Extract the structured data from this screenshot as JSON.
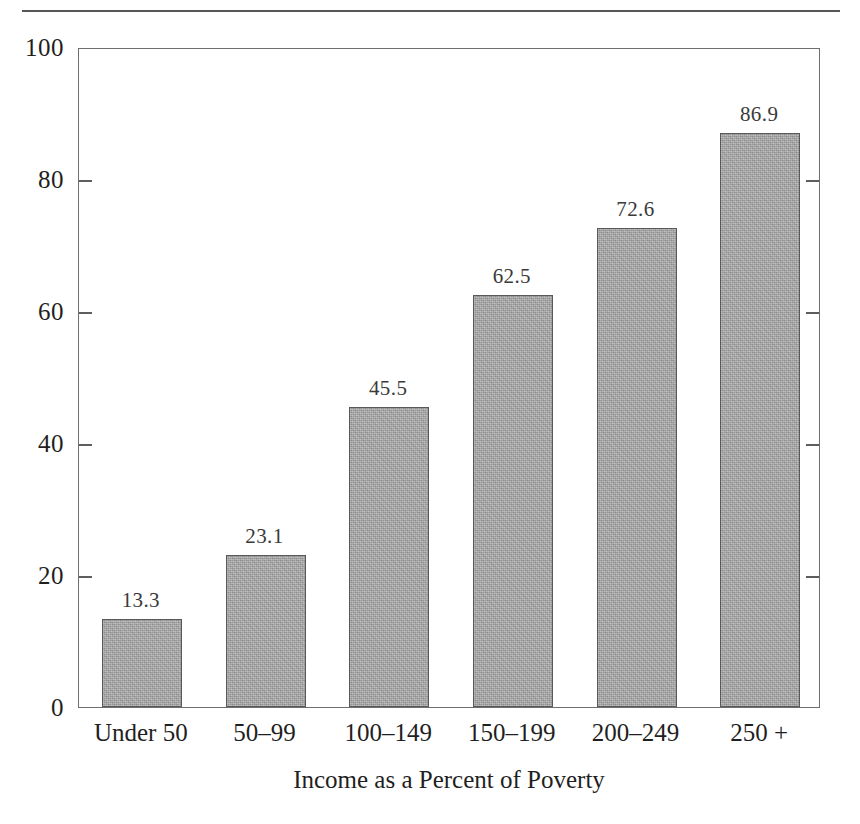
{
  "chart_data": {
    "type": "bar",
    "title": "",
    "subtitle": "",
    "xlabel": "Income as a Percent of Poverty",
    "ylabel": "",
    "categories": [
      "Under 50",
      "50–99",
      "100–149",
      "150–199",
      "200–249",
      "250 +"
    ],
    "values": [
      13.3,
      23.1,
      45.5,
      62.5,
      72.6,
      86.9
    ],
    "value_labels": [
      "13.3",
      "23.1",
      "45.5",
      "62.5",
      "72.6",
      "86.9"
    ],
    "ylim": [
      0,
      100
    ],
    "ytick_values": [
      0,
      20,
      40,
      60,
      80,
      100
    ],
    "ytick_labels": [
      "0",
      "20",
      "40",
      "60",
      "80",
      "100"
    ],
    "grid": false,
    "legend": null,
    "legend_position": "none",
    "bar_color": "#a9a9a9",
    "bar_border_color": "#59595c",
    "axis_color": "#6f6f6f",
    "text_color": "#1f1f1f"
  },
  "figure": {
    "top_rule_visible": true,
    "frame_visible": true,
    "ticks_inward": true,
    "ticks_both_sides": true
  }
}
